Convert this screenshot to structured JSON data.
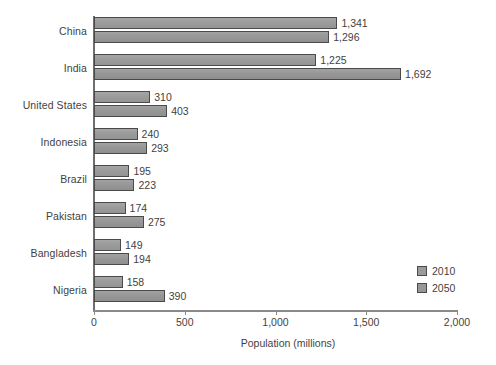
{
  "chart_data": {
    "type": "bar",
    "orientation": "horizontal",
    "title": "",
    "subtitle": "",
    "xlabel": "Population (millions)",
    "ylabel": "",
    "xlim": [
      0,
      2000
    ],
    "xticks": [
      0,
      500,
      1000,
      1500,
      2000
    ],
    "xtick_labels": [
      "0",
      "500",
      "1,000",
      "1,500",
      "2,000"
    ],
    "grid": false,
    "legend_position": "bottom-right",
    "categories": [
      "China",
      "India",
      "United States",
      "Indonesia",
      "Brazil",
      "Pakistan",
      "Bangladesh",
      "Nigeria"
    ],
    "series": [
      {
        "name": "2010",
        "color": "#9b9b9b",
        "values": [
          1341,
          1225,
          310,
          240,
          195,
          174,
          149,
          158
        ],
        "value_labels": [
          "1,341",
          "1,225",
          "310",
          "240",
          "195",
          "174",
          "149",
          "158"
        ]
      },
      {
        "name": "2050",
        "color": "#979797",
        "values": [
          1296,
          1692,
          403,
          293,
          223,
          275,
          194,
          390
        ],
        "value_labels": [
          "1,296",
          "1,692",
          "403",
          "293",
          "223",
          "275",
          "194",
          "390"
        ]
      }
    ]
  },
  "legend": {
    "items": [
      {
        "label": "2010",
        "color": "#9b9b9b"
      },
      {
        "label": "2050",
        "color": "#979797"
      }
    ]
  },
  "axis": {
    "x_title": "Population (millions)"
  },
  "colors": {
    "bar_2010": "#9b9b9b",
    "bar_2050": "#979797",
    "bar_border": "#4a4a4a",
    "axis": "#8a8a8a",
    "text": "#3f3f3f",
    "background": "#ffffff"
  }
}
